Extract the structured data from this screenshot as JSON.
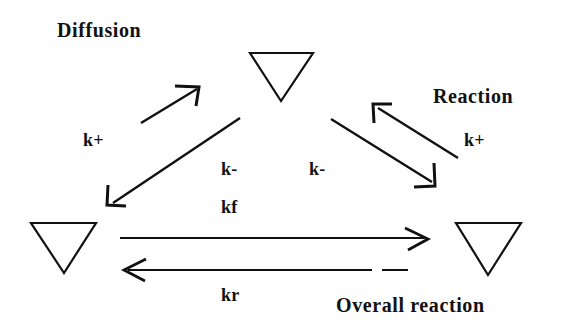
{
  "diagram": {
    "type": "reaction-scheme-triangle",
    "background_color": "#ffffff",
    "stroke_color": "#111111",
    "labels": {
      "diffusion": "Diffusion",
      "reaction": "Reaction",
      "k_plus_left": "k+",
      "k_plus_right": "k+",
      "k_minus_left": "k-",
      "k_minus_right": "k-",
      "kf": "kf",
      "kr": "kr",
      "overall_reaction": "Overall reaction"
    },
    "nodes": [
      {
        "name": "top-species",
        "shape": "triangle-down",
        "cx": 281,
        "cy": 52
      },
      {
        "name": "left-species",
        "shape": "triangle-down",
        "cx": 63,
        "cy": 222
      },
      {
        "name": "right-species",
        "shape": "triangle-down",
        "cx": 488,
        "cy": 222
      }
    ],
    "arrows": [
      {
        "name": "diffusion-forward-arrow",
        "from": "left-species",
        "to": "top-species",
        "rate": "k+"
      },
      {
        "name": "diffusion-reverse-arrow",
        "from": "top-species",
        "to": "left-species",
        "rate": "k-"
      },
      {
        "name": "reaction-forward-arrow",
        "from": "right-species",
        "to": "top-species",
        "rate": "k+"
      },
      {
        "name": "reaction-reverse-arrow",
        "from": "top-species",
        "to": "right-species",
        "rate": "k-"
      },
      {
        "name": "overall-forward-arrow",
        "from": "left-species",
        "to": "right-species",
        "rate": "kf"
      },
      {
        "name": "overall-reverse-arrow",
        "from": "right-species",
        "to": "left-species",
        "rate": "kr"
      }
    ]
  }
}
